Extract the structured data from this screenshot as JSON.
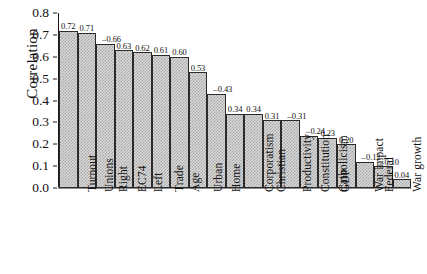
{
  "chart_data": {
    "type": "bar",
    "title": "",
    "xlabel": "",
    "ylabel": "Correlation",
    "ylim": [
      0.0,
      0.8
    ],
    "ytick_labels": [
      "0.8",
      "0.7",
      "0.6",
      "0.5",
      "0.4",
      "0.3",
      "0.2",
      "0.1",
      "0.0"
    ],
    "ytick_values": [
      0.8,
      0.7,
      0.6,
      0.5,
      0.4,
      0.3,
      0.2,
      0.1,
      0.0
    ],
    "grid": false,
    "legend": null,
    "categories": [
      "Turnout",
      "Unions",
      "Right",
      "EC74",
      "Left",
      "Trade",
      "Age",
      "Urban",
      "Home",
      "Corporatism",
      "Christian",
      "Productivity",
      "Constitution",
      "Catholicism",
      "GDP",
      "War impact",
      "Federal",
      "War growth",
      "Cath. culture"
    ],
    "values": [
      0.72,
      0.71,
      0.66,
      0.63,
      0.62,
      0.61,
      0.6,
      0.53,
      0.43,
      0.34,
      0.34,
      0.31,
      0.31,
      0.24,
      0.23,
      0.2,
      0.12,
      0.1,
      0.04
    ],
    "data_labels": [
      "0.72",
      "0.71",
      "0.66",
      "0.63",
      "0.62",
      "0.61",
      "0.60",
      "0.53",
      "0.43",
      "0.34",
      "0.34",
      "0.31",
      "0.31",
      "0.24",
      "0.23",
      "0.20",
      "0.12",
      "0.10",
      "0.04"
    ],
    "colors": {
      "bar_fill": "#d9d9d9",
      "bar_hatch": "#a8a8a8",
      "bar_edge": "#2b2b2b",
      "axis": "#1a1a1a",
      "text": "#111111",
      "background": "#ffffff"
    }
  }
}
